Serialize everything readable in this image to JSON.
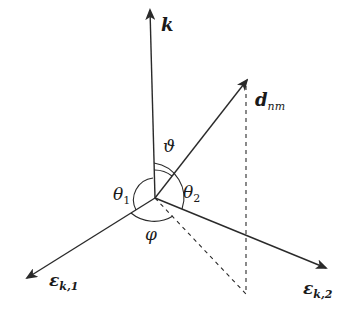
{
  "diagram": {
    "type": "vector-geometry",
    "colors": {
      "stroke": "#2a2a2a",
      "text": "#1a1a1a",
      "background": "#ffffff"
    },
    "vectors": [
      {
        "id": "k",
        "label": "k",
        "label_style": "bold-italic"
      },
      {
        "id": "d_nm",
        "label": "d",
        "subscript": "nm",
        "label_style": "bold-italic"
      },
      {
        "id": "eps_k1",
        "label": "ε",
        "subscript": "k,1"
      },
      {
        "id": "eps_k2",
        "label": "ε",
        "subscript": "k,2"
      }
    ],
    "angles": [
      {
        "id": "vartheta",
        "label": "ϑ",
        "between": [
          "k",
          "d_nm"
        ]
      },
      {
        "id": "theta1",
        "label": "θ",
        "subscript": "1",
        "between": [
          "k",
          "eps_k1"
        ]
      },
      {
        "id": "theta2",
        "label": "θ",
        "subscript": "2",
        "between": [
          "k",
          "eps_k2"
        ]
      },
      {
        "id": "varphi",
        "label": "φ",
        "between": [
          "eps_k1",
          "projection of d_nm"
        ]
      }
    ],
    "labels": {
      "k": "k",
      "d": "d",
      "d_sub": "nm",
      "vartheta": "ϑ",
      "theta": "θ",
      "theta1_sub": "1",
      "theta2_sub": "2",
      "varphi": "φ",
      "eps": "ε",
      "eps1_sub": "k,1",
      "eps2_sub": "k,2"
    }
  }
}
